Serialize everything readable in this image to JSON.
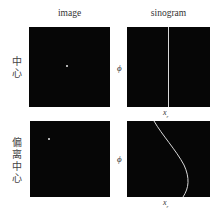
{
  "columns": {
    "image": "image",
    "sinogram": "sinogram"
  },
  "rows": [
    {
      "label_chars": [
        "中",
        "心"
      ],
      "label": "中心",
      "phi_label": "ϕ",
      "x_label": "x",
      "x_label_sub": "r",
      "sinogram_type": "vertical-line"
    },
    {
      "label_chars": [
        "偏",
        "离",
        "中",
        "心"
      ],
      "label": "偏离中心",
      "phi_label": "ϕ",
      "x_label": "x",
      "x_label_sub": "r",
      "sinogram_type": "sinusoid"
    }
  ],
  "colors": {
    "panel_bg": "#060606",
    "point": "#e8e8e8",
    "curve": "#d8d8d8"
  }
}
